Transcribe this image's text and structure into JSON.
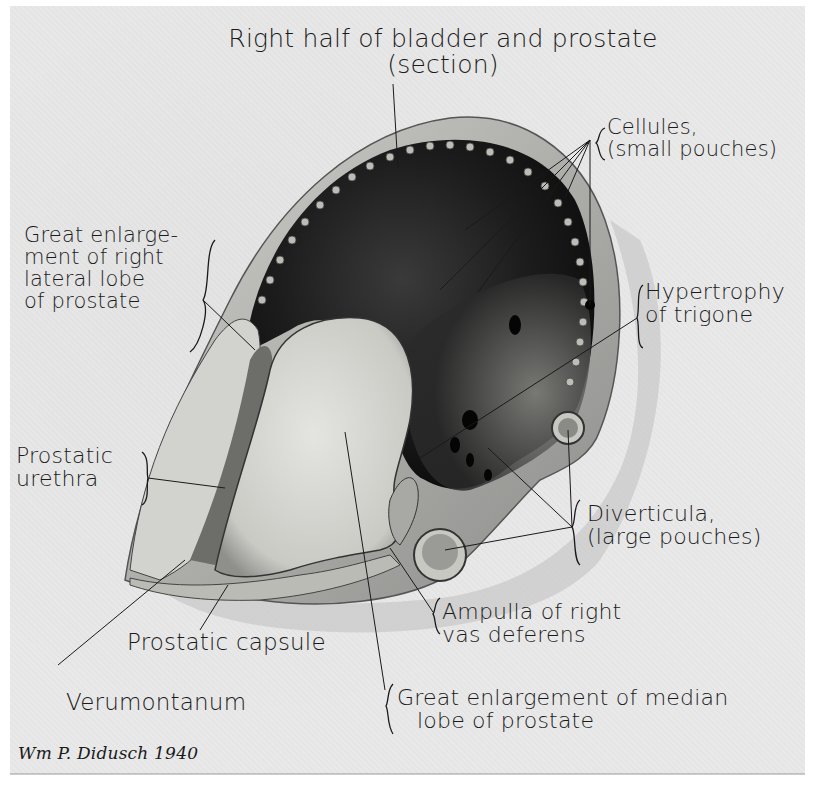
{
  "figure": {
    "type": "anatomical illustration",
    "subject": "Right half of bladder and prostate (section)",
    "signature": "Wm. P. Didusch 1940",
    "colors": {
      "paper": "#e9e9e9",
      "ink": "#1a1a1a",
      "tissue_dark": "#1e1e1e",
      "tissue_light": "#d6d6d2"
    }
  },
  "labels": {
    "title": {
      "line1": "Right half of bladder and prostate",
      "line2": "(section)"
    },
    "cellules": {
      "line1": "Cellules,",
      "line2": "(small pouches)"
    },
    "lateral_lobe": {
      "line1": "Great enlarge-",
      "line2": "ment of right",
      "line3": "lateral lobe",
      "line4": "of prostate"
    },
    "trigone": {
      "line1": "Hypertrophy",
      "line2": "of trigone"
    },
    "urethra": {
      "line1": "Prostatic",
      "line2": "urethra"
    },
    "diverticula": {
      "line1": "Diverticula,",
      "line2": "(large pouches)"
    },
    "ampulla": {
      "line1": "Ampulla of right",
      "line2": "vas deferens"
    },
    "capsule": {
      "line1": "Prostatic capsule"
    },
    "verumontanum": {
      "line1": "Verumontanum"
    },
    "median_lobe": {
      "line1": "Great enlargement of median",
      "line2": "lobe of prostate"
    },
    "signature": "Wm P. Didusch 1940"
  }
}
